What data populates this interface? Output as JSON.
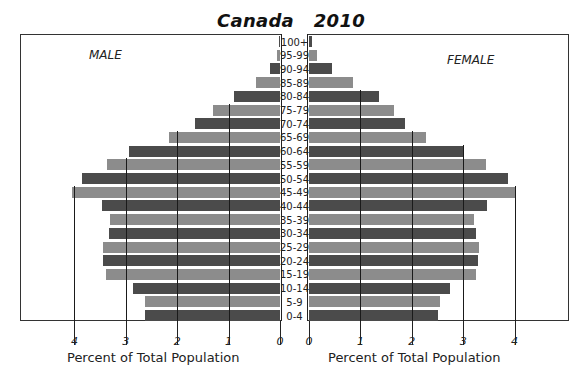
{
  "chart_data": {
    "type": "bar",
    "subtype": "population-pyramid",
    "title": "Canada   2010",
    "categories": [
      "100+",
      "95-99",
      "90-94",
      "85-89",
      "80-84",
      "75-79",
      "70-74",
      "65-69",
      "60-64",
      "55-59",
      "50-54",
      "45-49",
      "40-44",
      "35-39",
      "30-34",
      "25-29",
      "20-24",
      "15-19",
      "10-14",
      "5-9",
      "0-4"
    ],
    "series": [
      {
        "name": "MALE",
        "side": "left",
        "values": [
          0.02,
          0.05,
          0.2,
          0.47,
          0.9,
          1.3,
          1.65,
          2.16,
          2.94,
          3.37,
          3.86,
          4.05,
          3.47,
          3.3,
          3.33,
          3.45,
          3.45,
          3.39,
          2.86,
          2.63,
          2.63
        ]
      },
      {
        "name": "FEMALE",
        "side": "right",
        "values": [
          0.06,
          0.16,
          0.44,
          0.86,
          1.36,
          1.66,
          1.87,
          2.28,
          3.0,
          3.45,
          3.88,
          4.03,
          3.47,
          3.21,
          3.24,
          3.31,
          3.28,
          3.24,
          2.75,
          2.55,
          2.51
        ]
      }
    ],
    "xlabel": "Percent of Total Population",
    "ylabel": "",
    "xticks": [
      0,
      1,
      2,
      3,
      4
    ],
    "xlim": [
      0,
      4.7
    ],
    "grid": true,
    "colors": {
      "dark": "#4b4b4b",
      "light": "#8c8c8c"
    }
  },
  "labels": {
    "title": "Canada   2010",
    "male": "MALE",
    "female": "FEMALE",
    "xlabel_left": "Percent of Total Population",
    "xlabel_right": "Percent of Total Population",
    "ticks_left": [
      "4",
      "3",
      "2",
      "1",
      "0"
    ],
    "ticks_right": [
      "0",
      "1",
      "2",
      "3",
      "4"
    ]
  }
}
